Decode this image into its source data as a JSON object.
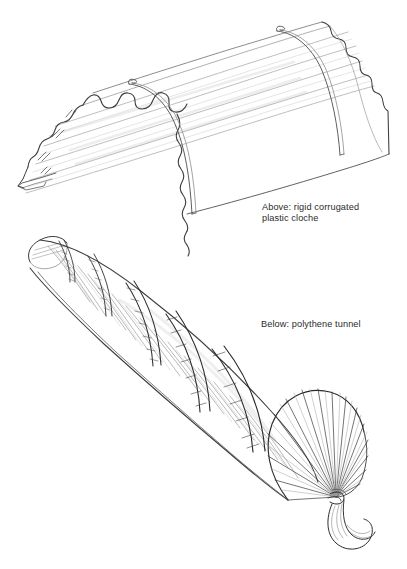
{
  "page": {
    "background_color": "#ffffff",
    "width": 407,
    "height": 569,
    "type": "line-drawing-illustration"
  },
  "captions": {
    "above": "Above: rigid corrugated\nplastic cloche",
    "below": "Below: polythene tunnel"
  },
  "illustrations": {
    "cloche": {
      "name": "rigid corrugated plastic cloche",
      "description": "Long barrel-vault tunnel of rigid corrugated plastic sheeting drawn in perspective, open at both ends, with two thin wire hoops encircling the span.",
      "features": [
        "corrugated ridge lines running lengthwise",
        "scalloped wavy near edge",
        "stepped scalloped far end profile",
        "two double-line wire hoops",
        "hatch shading marks at left end"
      ]
    },
    "tunnel": {
      "name": "polythene tunnel",
      "description": "Tapering polythene tunnel over hoops, drawn in perspective narrowing to the upper left, with hatched retaining straps and the polythene gathered and knotted at the open right end.",
      "features": [
        "five hatched cross-strap bands",
        "radiating gather lines in the sheeting",
        "domed closed end at upper left",
        "fan of gathered polythene at open end",
        "knotted curled tail of polythene"
      ]
    }
  },
  "colors": {
    "background": "#ffffff",
    "ink": "#3a3a3a",
    "ink_light": "#b9b9b9",
    "ink_faint": "#d8d8d8",
    "text": "#2b2b2b"
  }
}
